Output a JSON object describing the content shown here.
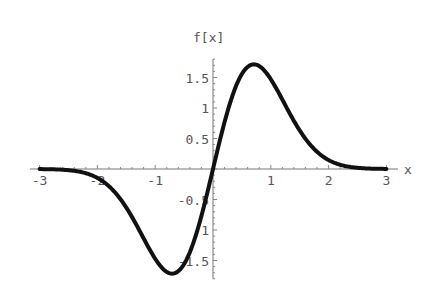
{
  "chart_data": {
    "type": "line",
    "title": "",
    "xlabel": "x",
    "ylabel": "f[x]",
    "xlim": [
      -3,
      3
    ],
    "ylim": [
      -1.8,
      1.8
    ],
    "x_ticks": [
      "-3",
      "-2",
      "-1",
      "1",
      "2",
      "3"
    ],
    "y_ticks": [
      "-1.5",
      "-1",
      "-0.5",
      "0.5",
      "1",
      "1.5"
    ],
    "grid": false,
    "legend": null,
    "series": [
      {
        "name": "f[x]",
        "x": [
          -3,
          -2.5,
          -2,
          -1.5,
          -1.2,
          -1,
          -0.8,
          -0.707,
          -0.6,
          -0.4,
          -0.2,
          0,
          0.2,
          0.4,
          0.6,
          0.707,
          0.8,
          1,
          1.2,
          1.5,
          2,
          2.5,
          3
        ],
        "values": [
          0.0,
          -0.02,
          -0.15,
          -0.63,
          -1.14,
          -1.47,
          -1.69,
          -1.72,
          -1.67,
          -1.36,
          -0.77,
          0,
          0.77,
          1.36,
          1.67,
          1.72,
          1.69,
          1.47,
          1.14,
          0.63,
          0.15,
          0.02,
          0.0
        ]
      }
    ],
    "color": "#111111"
  }
}
